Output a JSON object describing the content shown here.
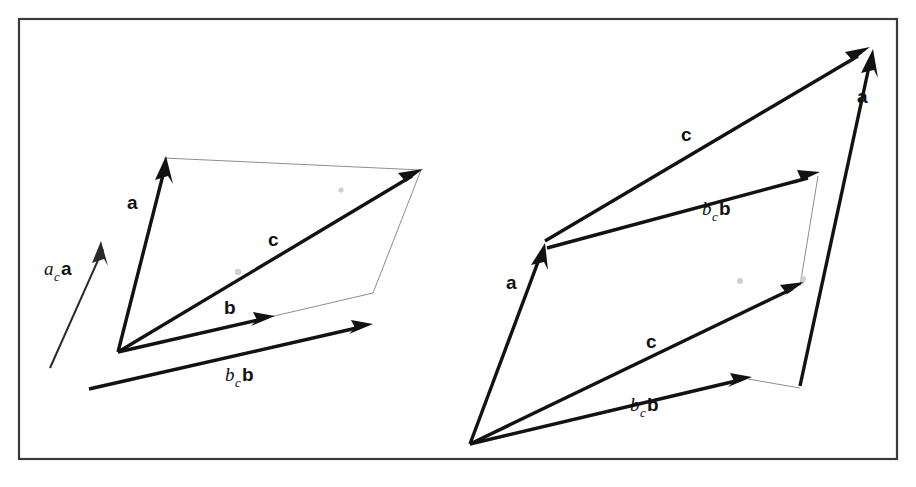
{
  "figure": {
    "background_color": "#ffffff",
    "frame_color": "#3a3a3a",
    "ink_color": "#121212",
    "construction_color": "#8d8d8d",
    "width": 916,
    "height": 487
  },
  "labels": {
    "a_bold": "a",
    "b_bold": "b",
    "c_bold": "c",
    "scalar_a": "a",
    "scalar_b": "b",
    "subscript_c": "c"
  },
  "panels": [
    {
      "id": "left-panel",
      "name": "left-vector-diagram",
      "description": "Parallelogram construction with a, b, c and scaled vectors a_c a and b_c b",
      "origin": [
        118,
        352
      ],
      "vectors": [
        {
          "name": "vector-a",
          "label": "a",
          "style": "bold",
          "from": [
            118,
            352
          ],
          "to": [
            164,
            158
          ],
          "label_pos": [
            134,
            203
          ],
          "label_kind": "bold"
        },
        {
          "name": "vector-b",
          "label": "b",
          "style": "bold",
          "from": [
            118,
            352
          ],
          "to": [
            272,
            317
          ],
          "label_pos": [
            232,
            307
          ],
          "label_kind": "bold"
        },
        {
          "name": "vector-c",
          "label": "c",
          "style": "bold",
          "from": [
            118,
            352
          ],
          "to": [
            421,
            170
          ],
          "label_pos": [
            274,
            239
          ],
          "label_kind": "bold"
        },
        {
          "name": "vector-ac-a",
          "label": "a_c a",
          "style": "thin",
          "from": [
            50,
            368
          ],
          "to": [
            101,
            242
          ],
          "label_pos": [
            53,
            268
          ],
          "label_kind": "scalar-a"
        },
        {
          "name": "vector-bc-b",
          "label": "b_c b",
          "style": "bold",
          "from": [
            89,
            389
          ],
          "to": [
            371,
            325
          ],
          "label_pos": [
            240,
            375
          ],
          "label_kind": "scalar-b"
        }
      ],
      "construction_lines": [
        {
          "name": "parallel-line-top",
          "from": [
            164,
            158
          ],
          "to": [
            421,
            170
          ]
        },
        {
          "name": "parallel-line-right",
          "from": [
            421,
            170
          ],
          "to": [
            373,
            293
          ]
        },
        {
          "name": "parallel-line-bottom",
          "from": [
            373,
            293
          ],
          "to": [
            118,
            352
          ]
        },
        {
          "name": "parallel-line-left",
          "from": [
            118,
            352
          ],
          "to": [
            164,
            158
          ]
        }
      ],
      "specks": [
        [
          238,
          271
        ],
        [
          340,
          189
        ]
      ]
    },
    {
      "id": "right-panel",
      "name": "right-vector-diagram",
      "description": "Head-to-tail vector addition shown twice: a then b_c b, and b_c b then a",
      "origin": [
        470,
        444
      ],
      "vectors": [
        {
          "name": "vector-a-lower-left",
          "label": "a",
          "style": "bold",
          "from": [
            470,
            444
          ],
          "to": [
            543,
            245
          ],
          "label_pos": [
            512,
            282
          ],
          "label_kind": "bold"
        },
        {
          "name": "vector-c-upper",
          "label": "c",
          "style": "bold",
          "from": [
            543,
            238
          ],
          "to": [
            868,
            48
          ],
          "label_pos": [
            686,
            133
          ],
          "label_kind": "bold"
        },
        {
          "name": "vector-bc-b-upper",
          "label": "b_c b",
          "style": "bold",
          "from": [
            545,
            246
          ],
          "to": [
            818,
            173
          ],
          "label_pos": [
            717,
            208
          ],
          "label_kind": "scalar-b"
        },
        {
          "name": "vector-c-lower",
          "label": "c",
          "style": "bold",
          "from": [
            470,
            444
          ],
          "to": [
            802,
            282
          ],
          "label_pos": [
            651,
            340
          ],
          "label_kind": "bold"
        },
        {
          "name": "vector-bc-b-lower",
          "label": "b_c b",
          "style": "bold",
          "from": [
            470,
            444
          ],
          "to": [
            750,
            378
          ],
          "label_pos": [
            645,
            404
          ],
          "label_kind": "scalar-b"
        },
        {
          "name": "vector-a-right",
          "label": "a",
          "style": "bold",
          "from": [
            800,
            386
          ],
          "to": [
            872,
            50
          ],
          "label_pos": [
            862,
            96
          ],
          "label_kind": "bold"
        }
      ],
      "construction_lines": [
        {
          "name": "thin-edge-right-lower",
          "from": [
            750,
            378
          ],
          "to": [
            800,
            386
          ]
        },
        {
          "name": "thin-edge-diagonal",
          "from": [
            802,
            282
          ],
          "to": [
            818,
            173
          ]
        }
      ],
      "specks": [
        [
          740,
          280
        ],
        [
          802,
          279
        ]
      ]
    }
  ],
  "frames": [
    {
      "name": "figure-border",
      "x": 18,
      "y": 18,
      "width": 880,
      "height": 442
    }
  ]
}
